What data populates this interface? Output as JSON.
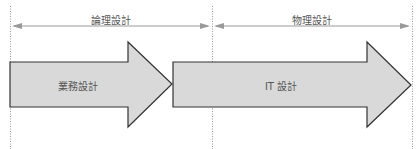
{
  "phases": [
    {
      "label": "論理設計",
      "x_start": 10,
      "x_end": 212
    },
    {
      "label": "物理設計",
      "x_start": 212,
      "x_end": 412
    }
  ],
  "arrows": [
    {
      "label": "業務設計"
    },
    {
      "label": "IT 設計"
    }
  ],
  "colors": {
    "arrow_fill": "#d9d9d9",
    "arrow_stroke": "#333333",
    "span_line": "#999999",
    "divider": "#999999",
    "text": "#555555"
  }
}
